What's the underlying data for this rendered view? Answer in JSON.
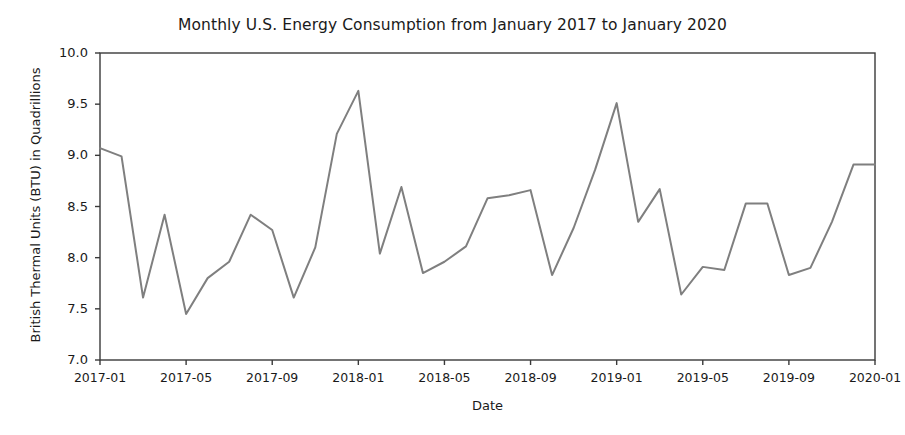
{
  "chart_data": {
    "type": "line",
    "title": "Monthly U.S. Energy Consumption from January 2017 to January 2020",
    "xlabel": "Date",
    "ylabel": "British Thermal Units (BTU) in Quadrillions",
    "ylim": [
      7.0,
      10.0
    ],
    "yticks": [
      "7.0",
      "7.5",
      "8.0",
      "8.5",
      "9.0",
      "9.5",
      "10.0"
    ],
    "ytick_values": [
      7.0,
      7.5,
      8.0,
      8.5,
      9.0,
      9.5,
      10.0
    ],
    "xticks": [
      "2017-01",
      "2017-05",
      "2017-09",
      "2018-01",
      "2018-05",
      "2018-09",
      "2019-01",
      "2019-05",
      "2019-09",
      "2020-01"
    ],
    "xtick_indices": [
      0,
      4,
      8,
      12,
      16,
      20,
      24,
      28,
      32,
      36
    ],
    "grid": false,
    "legend": null,
    "line_color": "#7f7f7f",
    "line_width": 2.0,
    "x": [
      "2017-01",
      "2017-02",
      "2017-03",
      "2017-04",
      "2017-05",
      "2017-06",
      "2017-07",
      "2017-08",
      "2017-09",
      "2017-10",
      "2017-11",
      "2017-12",
      "2018-01",
      "2018-02",
      "2018-03",
      "2018-04",
      "2018-05",
      "2018-06",
      "2018-07",
      "2018-08",
      "2018-09",
      "2018-10",
      "2018-11",
      "2018-12",
      "2019-01",
      "2019-02",
      "2019-03",
      "2019-04",
      "2019-05",
      "2019-06",
      "2019-07",
      "2019-08",
      "2019-09",
      "2019-10",
      "2019-11",
      "2019-12",
      "2020-01"
    ],
    "values": [
      9.07,
      8.99,
      7.61,
      8.42,
      7.45,
      7.8,
      7.96,
      8.42,
      8.27,
      7.61,
      8.1,
      9.21,
      9.63,
      8.04,
      8.69,
      7.85,
      7.96,
      8.11,
      8.58,
      8.61,
      8.66,
      7.83,
      8.29,
      8.86,
      9.51,
      8.35,
      8.67,
      7.64,
      7.91,
      7.88,
      8.53,
      8.53,
      7.83,
      7.9,
      8.35,
      8.91,
      8.91
    ]
  }
}
